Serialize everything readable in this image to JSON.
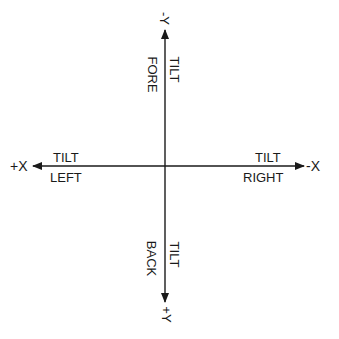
{
  "diagram": {
    "type": "tilt-axes",
    "colors": {
      "line": "#1a1a1a",
      "background": "#ffffff"
    },
    "axes": {
      "neg_y": {
        "label": "-Y",
        "direction": "up"
      },
      "pos_y": {
        "label": "+Y",
        "direction": "down"
      },
      "pos_x": {
        "label": "+X",
        "direction": "left"
      },
      "neg_x": {
        "label": "-X",
        "direction": "right"
      }
    },
    "tilt_labels": {
      "fore": {
        "line1": "TILT",
        "line2": "FORE"
      },
      "back": {
        "line1": "TILT",
        "line2": "BACK"
      },
      "left": {
        "line1": "TILT",
        "line2": "LEFT"
      },
      "right": {
        "line1": "TILT",
        "line2": "RIGHT"
      }
    }
  }
}
